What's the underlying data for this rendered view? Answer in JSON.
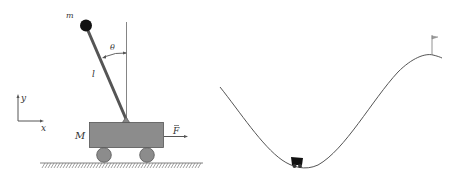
{
  "cartpole": {
    "mass_label": "m",
    "length_label": "l",
    "angle_label": "θ",
    "cart_mass_label": "M",
    "force_label": "F",
    "force_vector_mark": "→",
    "axis_x_label": "x",
    "axis_y_label": "y"
  },
  "mountain_car": {
    "goal": "flag"
  },
  "colors": {
    "cart_fill": "#8c8c8c",
    "wheel_fill": "#8c8c8c",
    "ball": "#111111",
    "rod": "#555555",
    "line": "#444444",
    "car": "#111111"
  }
}
